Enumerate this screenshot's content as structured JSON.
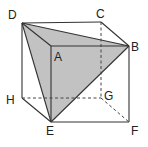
{
  "diagram": {
    "type": "cube-with-shaded-triangle",
    "colors": {
      "line": "#333333",
      "shade": "#c2c2c2",
      "label": "#222222"
    },
    "vertices": {
      "A": {
        "label": "A",
        "x": 51,
        "y": 46
      },
      "B": {
        "label": "B",
        "x": 129,
        "y": 46
      },
      "C": {
        "label": "C",
        "x": 101,
        "y": 22
      },
      "D": {
        "label": "D",
        "x": 22,
        "y": 23
      },
      "E": {
        "label": "E",
        "x": 51,
        "y": 122
      },
      "F": {
        "label": "F",
        "x": 129,
        "y": 122
      },
      "G": {
        "label": "G",
        "x": 101,
        "y": 98
      },
      "H": {
        "label": "H",
        "x": 22,
        "y": 98
      }
    },
    "shaded_triangle": [
      "D",
      "B",
      "E"
    ],
    "solid_edges": [
      [
        "D",
        "C"
      ],
      [
        "C",
        "B"
      ],
      [
        "D",
        "A"
      ],
      [
        "A",
        "B"
      ],
      [
        "D",
        "H"
      ],
      [
        "A",
        "E"
      ],
      [
        "B",
        "F"
      ],
      [
        "H",
        "E"
      ],
      [
        "E",
        "F"
      ],
      [
        "D",
        "B"
      ],
      [
        "D",
        "E"
      ],
      [
        "B",
        "E"
      ]
    ],
    "dashed_edges": [
      [
        "C",
        "G"
      ],
      [
        "H",
        "G"
      ],
      [
        "G",
        "F"
      ]
    ]
  }
}
